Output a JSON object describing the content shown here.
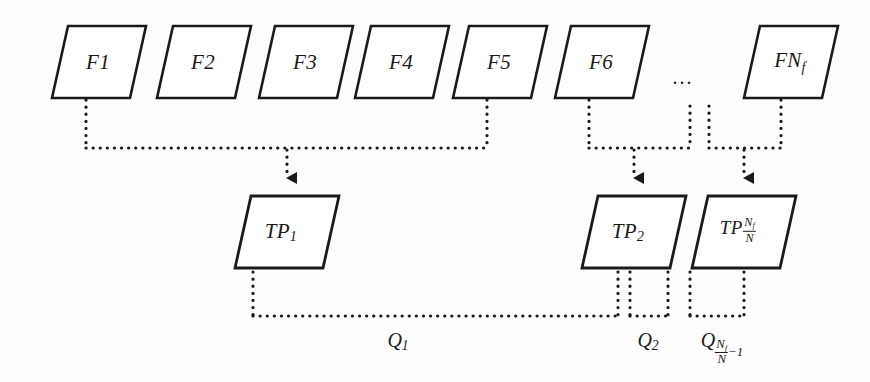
{
  "figure": {
    "type": "flow-diagram",
    "background_color": "#fdfdfd",
    "stroke_color": "#1a1a1a",
    "dotted_color": "#1a1a1a"
  },
  "frames": {
    "row_label": "frame-row",
    "items": [
      {
        "id": "f1",
        "text": "F1",
        "cx": 98,
        "cy": 62
      },
      {
        "id": "f2",
        "text": "F2",
        "cx": 203,
        "cy": 62
      },
      {
        "id": "f3",
        "text": "F3",
        "cx": 305,
        "cy": 62
      },
      {
        "id": "f4",
        "text": "F4",
        "cx": 401,
        "cy": 62
      },
      {
        "id": "f5",
        "text": "F5",
        "cx": 499,
        "cy": 62
      },
      {
        "id": "f6",
        "text": "F6",
        "cx": 601,
        "cy": 62
      },
      {
        "id": "fnf",
        "text_main": "FN",
        "text_sub": "f",
        "cx": 790,
        "cy": 62
      }
    ],
    "ellipsis": {
      "text": "...",
      "cx": 683,
      "cy": 77
    }
  },
  "time_periods": {
    "row_label": "time-period-row",
    "items": [
      {
        "id": "tp1",
        "text_main": "TP",
        "text_sub": "1",
        "cx": 281,
        "cy": 232
      },
      {
        "id": "tp2",
        "text_main": "TP",
        "text_sub": "2",
        "cx": 628,
        "cy": 232
      },
      {
        "id": "tpn",
        "text_main": "TP",
        "sub_num": "N",
        "sub_num_sub": "f",
        "sub_den": "N",
        "cx": 738,
        "cy": 232
      }
    ]
  },
  "queries": {
    "row_label": "query-bracket-row",
    "items": [
      {
        "id": "q1",
        "text_main": "Q",
        "text_sub": "1",
        "cx": 398,
        "cy": 340
      },
      {
        "id": "q2",
        "text_main": "Q",
        "text_sub": "2",
        "cx": 648,
        "cy": 340
      },
      {
        "id": "qn",
        "text_main": "Q",
        "sub_num": "N",
        "sub_num_sub": "f",
        "sub_den": "N",
        "sub_tail": "−1",
        "cx": 722,
        "cy": 340
      }
    ]
  },
  "geometry": {
    "parallelogram_skew_px": 16,
    "frame_box_width": 78,
    "frame_box_height": 72,
    "frame_top_y": 26,
    "frame_bottom_y": 98,
    "tp_box_width": 88,
    "tp_box_height": 72,
    "tp_top_y": 196,
    "tp_bottom_y": 268
  }
}
